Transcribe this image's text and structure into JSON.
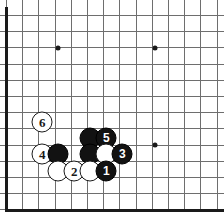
{
  "figure": {
    "board_style": "go-board-corner",
    "colors": {
      "background": "#ffffff",
      "grid_line": "#6e6e6e",
      "board_edge": "#1a1a1a",
      "black_stone": "#121212",
      "white_stone": "#ffffff",
      "black_label": "#ffffff",
      "white_label": "#1a1a1a"
    },
    "grid": {
      "spacing_px": 16.2,
      "origin_x": 6,
      "origin_y": 15,
      "columns": 14,
      "rows": 12,
      "edges": [
        "left",
        "bottom"
      ],
      "cropped_edges": [
        "top",
        "right"
      ]
    },
    "hoshi": [
      {
        "name": "star-point-upper-left",
        "x": 58,
        "y": 48
      },
      {
        "name": "star-point-upper-right",
        "x": 155,
        "y": 48
      },
      {
        "name": "star-point-lower-right",
        "x": 155,
        "y": 145
      }
    ],
    "stones": [
      {
        "id": "stone-white-6",
        "color": "white",
        "label": "6",
        "x": 42,
        "y": 122
      },
      {
        "id": "stone-black-a",
        "color": "black",
        "label": "",
        "x": 90,
        "y": 138
      },
      {
        "id": "stone-black-5",
        "color": "black",
        "label": "5",
        "x": 106,
        "y": 138
      },
      {
        "id": "stone-white-4",
        "color": "white",
        "label": "4",
        "x": 42,
        "y": 154
      },
      {
        "id": "stone-black-b",
        "color": "black",
        "label": "",
        "x": 58,
        "y": 154
      },
      {
        "id": "stone-black-c",
        "color": "black",
        "label": "",
        "x": 90,
        "y": 154
      },
      {
        "id": "stone-white-a",
        "color": "white",
        "label": "",
        "x": 106,
        "y": 154
      },
      {
        "id": "stone-black-3",
        "color": "black",
        "label": "3",
        "x": 122,
        "y": 154
      },
      {
        "id": "stone-white-b",
        "color": "white",
        "label": "",
        "x": 58,
        "y": 171
      },
      {
        "id": "stone-white-2",
        "color": "white",
        "label": "2",
        "x": 74,
        "y": 171
      },
      {
        "id": "stone-white-c",
        "color": "white",
        "label": "",
        "x": 90,
        "y": 171
      },
      {
        "id": "stone-black-1",
        "color": "black",
        "label": "1",
        "x": 106,
        "y": 171
      }
    ],
    "move_sequence": [
      "1",
      "2",
      "3",
      "4",
      "5",
      "6"
    ]
  }
}
